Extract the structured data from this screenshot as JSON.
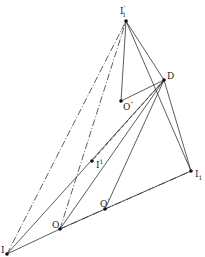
{
  "diagram": {
    "type": "geometric-construction",
    "points": {
      "I1p": {
        "label": "I",
        "sub": "1",
        "sup": "'",
        "x": 126,
        "y": 21
      },
      "D": {
        "label": "D",
        "x": 164,
        "y": 80
      },
      "O2": {
        "label": "O",
        "sup": "\"",
        "x": 121,
        "y": 101
      },
      "Ip": {
        "label": "I",
        "sup": "1",
        "x": 92,
        "y": 161
      },
      "Op": {
        "label": "O",
        "sup": "'",
        "x": 105,
        "y": 209
      },
      "O": {
        "label": "O",
        "x": 60,
        "y": 229
      },
      "I": {
        "label": "I",
        "x": 7,
        "y": 254
      },
      "I1": {
        "label": "I",
        "sub": "1",
        "x": 191,
        "y": 171
      }
    },
    "segments": [
      {
        "from": "I1p",
        "to": "O2",
        "style": "solid"
      },
      {
        "from": "I1p",
        "to": "D",
        "style": "solid"
      },
      {
        "from": "O2",
        "to": "D",
        "style": "solid"
      },
      {
        "from": "I1p",
        "to": "I1",
        "style": "solid"
      },
      {
        "from": "D",
        "to": "I1",
        "style": "solid"
      },
      {
        "from": "D",
        "to": "Op",
        "style": "solid"
      },
      {
        "from": "D",
        "to": "O",
        "style": "solid"
      },
      {
        "from": "D",
        "to": "Ip",
        "style": "dashed"
      },
      {
        "from": "O",
        "to": "Op",
        "style": "solid"
      },
      {
        "from": "Op",
        "to": "I1",
        "style": "solid"
      },
      {
        "from": "O",
        "to": "I1",
        "style": "dashdot"
      },
      {
        "from": "I",
        "to": "O",
        "style": "solid"
      },
      {
        "from": "I",
        "to": "I1p",
        "style": "dashdot"
      },
      {
        "from": "O",
        "to": "I1p",
        "style": "dashdot"
      },
      {
        "from": "I",
        "to": "D",
        "style": "solid"
      }
    ]
  },
  "labels": {
    "I1p": {
      "base": "I",
      "sub": "1",
      "sup": "'"
    },
    "D": {
      "base": "D"
    },
    "O2": {
      "base": "O",
      "sup": "\""
    },
    "Ip": {
      "base": "I",
      "sup": "1"
    },
    "Op": {
      "base": "O",
      "sup": "'"
    },
    "O": {
      "base": "O"
    },
    "I": {
      "base": "I"
    },
    "I1": {
      "base": "I",
      "sub": "1"
    }
  },
  "colors": {
    "line": "#333333",
    "point": "#111111",
    "background": "#ffffff"
  }
}
